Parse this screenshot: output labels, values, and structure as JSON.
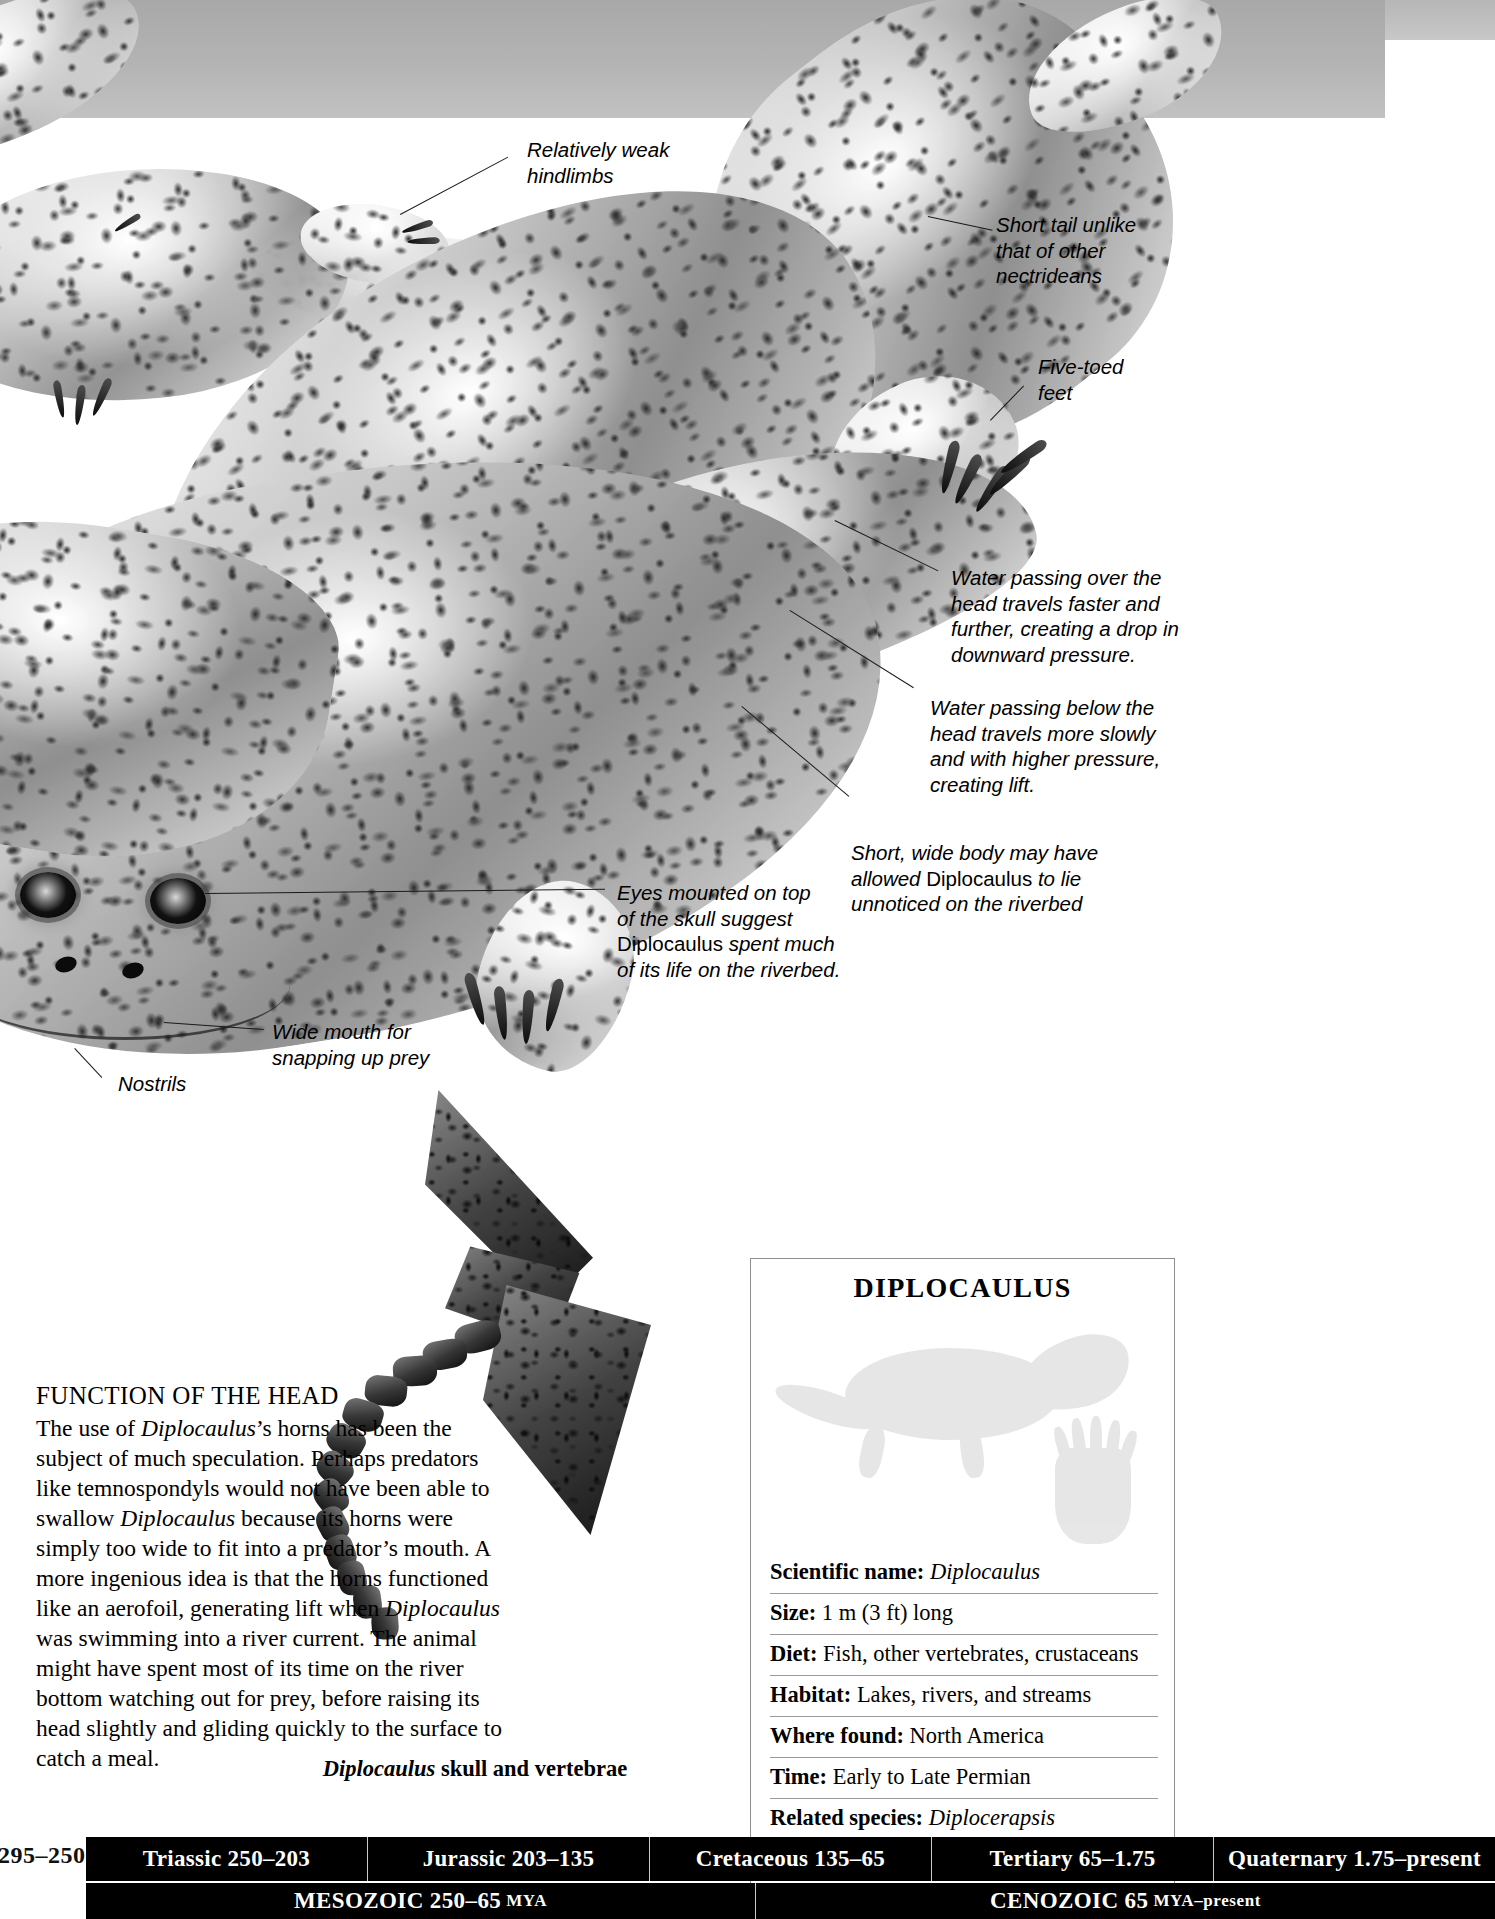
{
  "running_head": "LEPOSPONDYLS AND LISSAMPHIBIANS",
  "callouts": [
    {
      "id": "hindlimbs",
      "text": "Relatively weak\nhindlimbs"
    },
    {
      "id": "short-tail",
      "text": "Short tail unlike\nthat of other\nnectrideans"
    },
    {
      "id": "five-toed",
      "text": "Five-toed\nfeet"
    },
    {
      "id": "water-over",
      "text": "Water passing over the\nhead travels faster and\nfurther, creating a drop in\ndownward pressure."
    },
    {
      "id": "water-below",
      "text": "Water passing below the\nhead travels more slowly\nand with higher pressure,\ncreating lift."
    },
    {
      "id": "wide-body",
      "pre": "Short, wide body may have\nallowed ",
      "roman": "Diplocaulus",
      "post": " to lie\nunnoticed on the riverbed"
    },
    {
      "id": "eyes",
      "pre": "Eyes mounted on top\nof the skull suggest\n",
      "roman": "Diplocaulus",
      "post": " spent much\nof its life on the riverbed."
    },
    {
      "id": "wide-mouth",
      "text": "Wide mouth for\nsnapping up prey"
    },
    {
      "id": "nostrils",
      "text": "Nostrils"
    }
  ],
  "feature": {
    "heading": "FUNCTION OF THE HEAD",
    "paragraph_runs": [
      {
        "t": "The use of ",
        "i": false
      },
      {
        "t": "Diplocaulus",
        "i": true
      },
      {
        "t": "’s horns has been the subject of much speculation. Perhaps predators like temnospondyls would not have been able to swallow ",
        "i": false
      },
      {
        "t": "Diplocaulus",
        "i": true
      },
      {
        "t": " because its horns were simply too wide to fit into a predator’s mouth. A more ingenious idea is that the horns functioned like an aerofoil, generating lift when ",
        "i": false
      },
      {
        "t": "Diplocaulus",
        "i": true
      },
      {
        "t": " was swimming into a river current. The animal might have spent most of its time on the river bottom watching out for prey, before raising its head slightly and gliding quickly to the surface to catch a meal.",
        "i": false
      }
    ]
  },
  "fossil_caption": {
    "italic": "Diplocaulus",
    "rest": " skull and vertebrae"
  },
  "factbox": {
    "title": "DIPLOCAULUS",
    "rows": [
      {
        "label": "Scientific name:",
        "value": "Diplocaulus",
        "value_italic": true
      },
      {
        "label": "Size:",
        "value": "1 m (3 ft) long",
        "value_italic": false
      },
      {
        "label": "Diet:",
        "value": "Fish, other vertebrates, crustaceans",
        "value_italic": false
      },
      {
        "label": "Habitat:",
        "value": "Lakes, rivers, and streams",
        "value_italic": false
      },
      {
        "label": "Where found:",
        "value": "North America",
        "value_italic": false
      },
      {
        "label": "Time:",
        "value": "Early to Late Permian",
        "value_italic": false
      },
      {
        "label": "Related species:",
        "value": "Diplocerapsis",
        "value_italic": true
      }
    ]
  },
  "timeline": {
    "previous_period": "295–250",
    "periods": [
      "Triassic 250–203",
      "Jurassic 203–135",
      "Cretaceous 135–65",
      "Tertiary 65–1.75",
      "Quaternary 1.75–present"
    ],
    "eras": [
      {
        "name": "MESOZOIC 250–65",
        "suffix": "MYA"
      },
      {
        "name": "CENOZOIC 65",
        "suffix": "MYA–present"
      }
    ]
  },
  "colors": {
    "ink": "#000000",
    "water_band": "#b4b4b4",
    "rule": "#9a9a9a",
    "timeline_bg": "#000000",
    "timeline_text": "#ffffff"
  }
}
